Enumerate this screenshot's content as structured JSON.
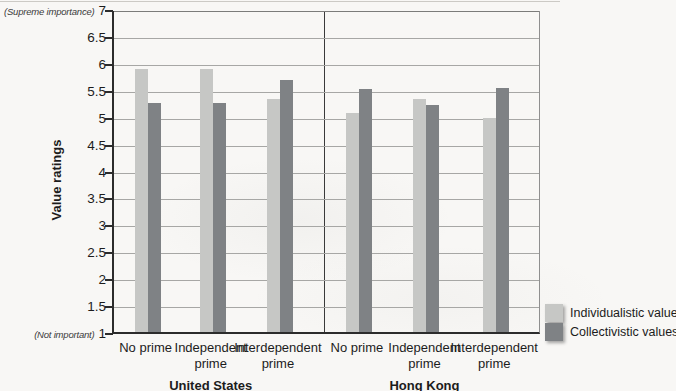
{
  "chart_data": {
    "type": "bar",
    "title": "",
    "ylabel": "Value ratings",
    "y_axis": {
      "min": 1,
      "max": 7,
      "step": 0.5,
      "max_annotation": "(Supreme importance)",
      "min_annotation": "(Not important)"
    },
    "grid": true,
    "legend_position": "bottom-right",
    "sections": [
      {
        "label": "United States",
        "categories": [
          "No prime",
          "Independent prime",
          "Interdependent prime"
        ]
      },
      {
        "label": "Hong Kong",
        "categories": [
          "No prime",
          "Independent prime",
          "Interdependent prime"
        ]
      }
    ],
    "series": [
      {
        "name": "Individualistic values",
        "color": "#c6c7c5",
        "values": [
          5.88,
          5.88,
          5.33,
          5.07,
          5.32,
          4.97
        ]
      },
      {
        "name": "Collectivistic values",
        "color": "#7f8285",
        "values": [
          5.25,
          5.25,
          5.68,
          5.52,
          5.21,
          5.53
        ]
      }
    ]
  }
}
